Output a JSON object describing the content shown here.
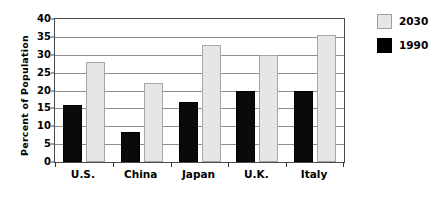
{
  "chart_data": {
    "type": "bar",
    "title": "",
    "xlabel": "",
    "ylabel": "Percent of Population",
    "ylim": [
      0,
      40
    ],
    "yticks": [
      0,
      5,
      10,
      15,
      20,
      25,
      30,
      35,
      40
    ],
    "ytick_labels": [
      "0",
      "5",
      "10",
      "15",
      "20",
      "25",
      "30",
      "35",
      "40"
    ],
    "grid": true,
    "legend_position": "right",
    "categories": [
      "U.S.",
      "China",
      "Japan",
      "U.K.",
      "Italy"
    ],
    "series": [
      {
        "name": "1990",
        "color": "#000000",
        "values": [
          16.0,
          8.5,
          16.7,
          20.0,
          20.0
        ]
      },
      {
        "name": "2030",
        "color": "#e6e6e6",
        "values": [
          28.0,
          22.0,
          32.8,
          30.0,
          35.5
        ]
      }
    ]
  },
  "legend": {
    "entries": [
      {
        "label": "2030",
        "swatch": "light-gray-square"
      },
      {
        "label": "1990",
        "swatch": "black-square"
      }
    ]
  }
}
